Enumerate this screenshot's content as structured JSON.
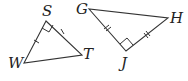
{
  "figures": [
    {
      "name": "triangle-SWT",
      "vertices": [
        {
          "label": "S",
          "x": 46,
          "y": 21
        },
        {
          "label": "W",
          "x": 24,
          "y": 63
        },
        {
          "label": "T",
          "x": 82,
          "y": 55
        }
      ],
      "right_angle_at": "S",
      "congruent_segments": [
        "SW",
        "ST"
      ],
      "tick_count": 1
    },
    {
      "name": "triangle-GJH",
      "vertices": [
        {
          "label": "G",
          "x": 89,
          "y": 9
        },
        {
          "label": "J",
          "x": 126,
          "y": 51
        },
        {
          "label": "H",
          "x": 168,
          "y": 18
        }
      ],
      "right_angle_at": "J",
      "congruent_segments": [
        "GJ",
        "JH"
      ],
      "tick_count": 2
    }
  ],
  "labels": {
    "S": "S",
    "W": "W",
    "T": "T",
    "G": "G",
    "H": "H",
    "J": "J"
  },
  "colors": {
    "stroke": "#333333",
    "text": "#222222",
    "background": "#ffffff"
  }
}
